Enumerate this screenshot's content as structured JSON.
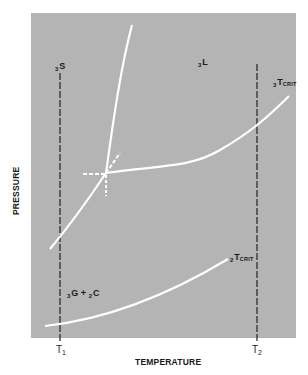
{
  "diagram": {
    "type": "phase-diagram",
    "background_color": "#b4b4b4",
    "curve_color": "#ffffff",
    "axes": {
      "x_title": "TEMPERATURE",
      "y_title": "PRESSURE",
      "x_ticks": [
        {
          "main": "T",
          "sub": "1"
        },
        {
          "main": "T",
          "sub": "2"
        }
      ]
    },
    "regions": {
      "solid": {
        "pre": "3",
        "main": "S"
      },
      "liquid": {
        "pre": "3",
        "main": "L"
      },
      "gas_plus": {
        "pre1": "3",
        "main1": "G",
        "op": " + ",
        "pre2": "2",
        "main2": "C"
      }
    },
    "critical_points": {
      "upper": {
        "pre": "3",
        "main": "T",
        "sub": "CRIT"
      },
      "lower": {
        "pre": "2",
        "main": "T",
        "sub": "CRIT"
      }
    },
    "curves": [
      {
        "name": "fusion-curve",
        "from": [
          106,
          173
        ],
        "to": [
          132,
          25
        ]
      },
      {
        "name": "sublimation-curve",
        "from": [
          50,
          249
        ],
        "to": [
          106,
          173
        ]
      },
      {
        "name": "vaporization-curve",
        "from": [
          106,
          173
        ],
        "to": [
          289,
          96
        ]
      },
      {
        "name": "lower-vapor-curve",
        "from": [
          45,
          326
        ],
        "to": [
          228,
          259
        ]
      }
    ],
    "isotherms": [
      {
        "name": "T1",
        "x": 60,
        "y_top": 73,
        "y_bottom": 343
      },
      {
        "name": "T2",
        "x": 257,
        "y_top": 64,
        "y_bottom": 343
      }
    ]
  }
}
